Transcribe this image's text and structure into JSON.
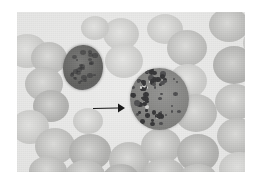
{
  "image": {
    "kind": "photomicrograph",
    "title": "Peripheral blood smear photomicrograph",
    "modality": "light microscopy, Wright-Giemsa stained blood film",
    "rendering": "grayscale",
    "canvas": {
      "width": 256,
      "height": 184,
      "background_color": "#ffffff"
    },
    "plate": {
      "x": 17,
      "y": 12,
      "width": 228,
      "height": 160,
      "background_color": "#ececeb",
      "border": "none"
    }
  },
  "palette": {
    "page_background": "#ffffff",
    "field_background": "#ececeb",
    "erythrocyte_fill": "#c2c2c0",
    "erythrocyte_center": "#dededc",
    "lymphocyte_nucleus": "#54544f",
    "granulocyte_cytoplasm": "#7b7b79",
    "granule_dark": "#1d1d1f",
    "arrow_color": "#1a1a1a"
  },
  "annotations": {
    "arrow": {
      "name": "pointer-arrow",
      "direction": "right",
      "x": 92,
      "y": 101,
      "length": 28,
      "thickness": 1,
      "color": "#1a1a1a",
      "points_to": "granulated-cell"
    }
  },
  "cells": {
    "lymphocyte": {
      "label": "dark-staining mononuclear cell",
      "x": 46,
      "y": 33,
      "width": 40,
      "height": 45
    },
    "granulocyte": {
      "label": "granulated cell with coarse dark granules",
      "x": 113,
      "y": 56,
      "width": 59,
      "height": 62,
      "granule_count": 58
    },
    "erythrocytes": [
      {
        "x": -10,
        "y": 22,
        "w": 40,
        "h": 34,
        "tone": "pale"
      },
      {
        "x": 14,
        "y": 30,
        "w": 36,
        "h": 32,
        "tone": "normal"
      },
      {
        "x": 8,
        "y": 55,
        "w": 38,
        "h": 34,
        "tone": "normal"
      },
      {
        "x": 16,
        "y": 78,
        "w": 36,
        "h": 32,
        "tone": "dark"
      },
      {
        "x": -6,
        "y": 98,
        "w": 38,
        "h": 34,
        "tone": "pale"
      },
      {
        "x": 18,
        "y": 116,
        "w": 40,
        "h": 36,
        "tone": "normal"
      },
      {
        "x": 12,
        "y": 144,
        "w": 38,
        "h": 30,
        "tone": "normal"
      },
      {
        "x": 52,
        "y": 122,
        "w": 42,
        "h": 36,
        "tone": "dark"
      },
      {
        "x": 48,
        "y": 148,
        "w": 40,
        "h": 30,
        "tone": "normal"
      },
      {
        "x": 86,
        "y": 6,
        "w": 36,
        "h": 32,
        "tone": "pale"
      },
      {
        "x": 88,
        "y": 32,
        "w": 38,
        "h": 34,
        "tone": "pale"
      },
      {
        "x": 92,
        "y": 130,
        "w": 40,
        "h": 36,
        "tone": "normal"
      },
      {
        "x": 86,
        "y": 152,
        "w": 36,
        "h": 28,
        "tone": "dark"
      },
      {
        "x": 124,
        "y": 116,
        "w": 40,
        "h": 36,
        "tone": "normal"
      },
      {
        "x": 126,
        "y": 146,
        "w": 42,
        "h": 32,
        "tone": "normal"
      },
      {
        "x": 130,
        "y": 2,
        "w": 36,
        "h": 30,
        "tone": "pale"
      },
      {
        "x": 150,
        "y": 18,
        "w": 40,
        "h": 36,
        "tone": "normal"
      },
      {
        "x": 152,
        "y": 52,
        "w": 38,
        "h": 34,
        "tone": "pale"
      },
      {
        "x": 158,
        "y": 82,
        "w": 42,
        "h": 38,
        "tone": "normal"
      },
      {
        "x": 160,
        "y": 122,
        "w": 42,
        "h": 38,
        "tone": "dark"
      },
      {
        "x": 162,
        "y": 152,
        "w": 38,
        "h": 28,
        "tone": "normal"
      },
      {
        "x": 192,
        "y": -4,
        "w": 40,
        "h": 34,
        "tone": "normal"
      },
      {
        "x": 196,
        "y": 34,
        "w": 42,
        "h": 38,
        "tone": "dark"
      },
      {
        "x": 198,
        "y": 72,
        "w": 40,
        "h": 36,
        "tone": "normal"
      },
      {
        "x": 200,
        "y": 106,
        "w": 40,
        "h": 36,
        "tone": "normal"
      },
      {
        "x": 202,
        "y": 140,
        "w": 40,
        "h": 34,
        "tone": "pale"
      },
      {
        "x": 226,
        "y": 16,
        "w": 34,
        "h": 30,
        "tone": "pale"
      },
      {
        "x": 56,
        "y": 96,
        "w": 30,
        "h": 26,
        "tone": "pale"
      },
      {
        "x": 64,
        "y": 4,
        "w": 28,
        "h": 24,
        "tone": "pale"
      }
    ]
  }
}
